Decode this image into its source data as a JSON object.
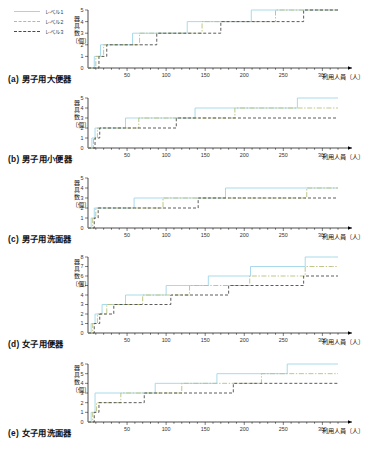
{
  "figure": {
    "legend": {
      "position": "top-left",
      "items": [
        {
          "label": "レベル1",
          "style": "solid",
          "color": "#9fd6e8"
        },
        {
          "label": "レベル2",
          "style": "dashdot",
          "color": "#b9bf7a"
        },
        {
          "label": "レベル3",
          "style": "dashed",
          "color": "#4a4a4a"
        }
      ]
    },
    "axis_titles": {
      "y": "器具数〔個〕",
      "x": "利用人員〔人〕"
    }
  },
  "chart_data": [
    {
      "type": "line",
      "panel": "a",
      "title": "(a) 男子用大便器",
      "xlabel": "利用人員〔人〕",
      "ylabel": "器具数〔個〕",
      "xlim": [
        0,
        320
      ],
      "ylim": [
        0,
        5
      ],
      "xticks": [
        50,
        100,
        150,
        200,
        250,
        300
      ],
      "yticks": [
        0,
        1,
        2,
        3,
        4,
        5
      ],
      "grid": false,
      "step": "post",
      "series": [
        {
          "name": "レベル1",
          "color": "#9fd6e8",
          "style": "solid",
          "x": [
            0,
            8,
            16,
            57,
            127,
            209,
            313
          ],
          "y": [
            0,
            1,
            2,
            3,
            4,
            5,
            5
          ]
        },
        {
          "name": "レベル2",
          "color": "#b9bf7a",
          "style": "dashdot",
          "x": [
            0,
            10,
            20,
            66,
            146,
            240,
            313
          ],
          "y": [
            0,
            1,
            2,
            3,
            4,
            5,
            5
          ]
        },
        {
          "name": "レベル3",
          "color": "#4a4a4a",
          "style": "dashed",
          "x": [
            0,
            14,
            24,
            88,
            170,
            276,
            313
          ],
          "y": [
            0,
            1,
            2,
            3,
            4,
            5,
            5
          ]
        }
      ]
    },
    {
      "type": "line",
      "panel": "b",
      "title": "(b) 男子用小便器",
      "xlabel": "利用人員〔人〕",
      "ylabel": "器具数〔個〕",
      "xlim": [
        0,
        320
      ],
      "ylim": [
        0,
        5
      ],
      "xticks": [
        50,
        100,
        150,
        200,
        250,
        300
      ],
      "yticks": [
        0,
        1,
        2,
        3,
        4,
        5
      ],
      "grid": false,
      "step": "post",
      "series": [
        {
          "name": "レベル1",
          "color": "#9fd6e8",
          "style": "solid",
          "x": [
            0,
            5,
            9,
            48,
            137,
            268,
            313
          ],
          "y": [
            0,
            1,
            2,
            3,
            4,
            5,
            5
          ]
        },
        {
          "name": "レベル2",
          "color": "#b9bf7a",
          "style": "dashdot",
          "x": [
            0,
            7,
            12,
            65,
            188,
            313
          ],
          "y": [
            0,
            1,
            2,
            3,
            4,
            4
          ]
        },
        {
          "name": "レベル3",
          "color": "#4a4a4a",
          "style": "dashed",
          "x": [
            0,
            9,
            15,
            113,
            313
          ],
          "y": [
            0,
            1,
            2,
            3,
            3
          ]
        }
      ]
    },
    {
      "type": "line",
      "panel": "c",
      "title": "(c) 男子用洗面器",
      "xlabel": "利用人員〔人〕",
      "ylabel": "器具数〔個〕",
      "xlim": [
        0,
        320
      ],
      "ylim": [
        0,
        5
      ],
      "xticks": [
        50,
        100,
        150,
        200,
        250,
        300
      ],
      "yticks": [
        0,
        1,
        2,
        3,
        4,
        5
      ],
      "grid": false,
      "step": "post",
      "series": [
        {
          "name": "レベル1",
          "color": "#9fd6e8",
          "style": "solid",
          "x": [
            0,
            4,
            8,
            59,
            176,
            313
          ],
          "y": [
            0,
            1,
            2,
            3,
            4,
            4
          ]
        },
        {
          "name": "レベル2",
          "color": "#b9bf7a",
          "style": "dashdot",
          "x": [
            0,
            6,
            10,
            96,
            280,
            313
          ],
          "y": [
            0,
            1,
            2,
            3,
            4,
            4
          ]
        },
        {
          "name": "レベル3",
          "color": "#4a4a4a",
          "style": "dashed",
          "x": [
            0,
            8,
            13,
            141,
            313
          ],
          "y": [
            0,
            1,
            2,
            3,
            3
          ]
        }
      ]
    },
    {
      "type": "line",
      "panel": "d",
      "title": "(d) 女子用便器",
      "xlabel": "利用人員〔人〕",
      "ylabel": "器具数〔個〕",
      "xlim": [
        0,
        320
      ],
      "ylim": [
        0,
        8
      ],
      "xticks": [
        50,
        100,
        150,
        200,
        250,
        300
      ],
      "yticks": [
        0,
        1,
        2,
        3,
        4,
        5,
        6,
        7,
        8
      ],
      "grid": false,
      "step": "post",
      "series": [
        {
          "name": "レベル1",
          "color": "#9fd6e8",
          "style": "solid",
          "x": [
            0,
            4,
            9,
            18,
            48,
            100,
            154,
            208,
            278,
            313
          ],
          "y": [
            0,
            1,
            2,
            3,
            4,
            5,
            6,
            7,
            8,
            8
          ]
        },
        {
          "name": "レベル2",
          "color": "#b9bf7a",
          "style": "dashdot",
          "x": [
            0,
            6,
            12,
            24,
            70,
            130,
            207,
            278,
            313
          ],
          "y": [
            0,
            1,
            2,
            3,
            4,
            5,
            6,
            7,
            7
          ]
        },
        {
          "name": "レベル3",
          "color": "#4a4a4a",
          "style": "dashed",
          "x": [
            0,
            8,
            15,
            33,
            106,
            180,
            276,
            313
          ],
          "y": [
            0,
            1,
            2,
            3,
            4,
            5,
            6,
            6
          ]
        }
      ]
    },
    {
      "type": "line",
      "panel": "e",
      "title": "(e) 女子用洗面器",
      "xlabel": "利用人員〔人〕",
      "ylabel": "器具数〔個〕",
      "xlim": [
        0,
        320
      ],
      "ylim": [
        0,
        6
      ],
      "xticks": [
        50,
        100,
        150,
        200,
        250,
        300
      ],
      "yticks": [
        0,
        1,
        2,
        3,
        4,
        5,
        6
      ],
      "grid": false,
      "step": "post",
      "series": [
        {
          "name": "レベル1",
          "color": "#9fd6e8",
          "style": "solid",
          "x": [
            0,
            4,
            9,
            86,
            165,
            255,
            313
          ],
          "y": [
            0,
            1,
            3,
            4,
            5,
            6,
            6
          ]
        },
        {
          "name": "レベル2",
          "color": "#b9bf7a",
          "style": "dashdot",
          "x": [
            0,
            6,
            11,
            42,
            120,
            222,
            313
          ],
          "y": [
            0,
            1,
            2,
            3,
            4,
            5,
            5
          ]
        },
        {
          "name": "レベル3",
          "color": "#4a4a4a",
          "style": "dashed",
          "x": [
            0,
            8,
            14,
            72,
            186,
            313
          ],
          "y": [
            0,
            1,
            2,
            3,
            4,
            4
          ]
        }
      ]
    }
  ]
}
